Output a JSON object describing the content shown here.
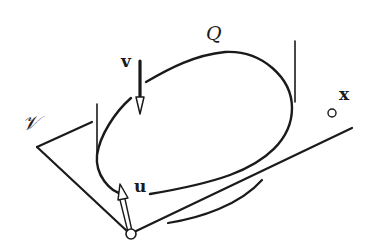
{
  "labels": {
    "Q": "Q",
    "v": "v",
    "u": "u",
    "x": "x",
    "V": "𝒱"
  },
  "colors": {
    "stroke": "#1a1a1a",
    "background": "#ffffff"
  }
}
